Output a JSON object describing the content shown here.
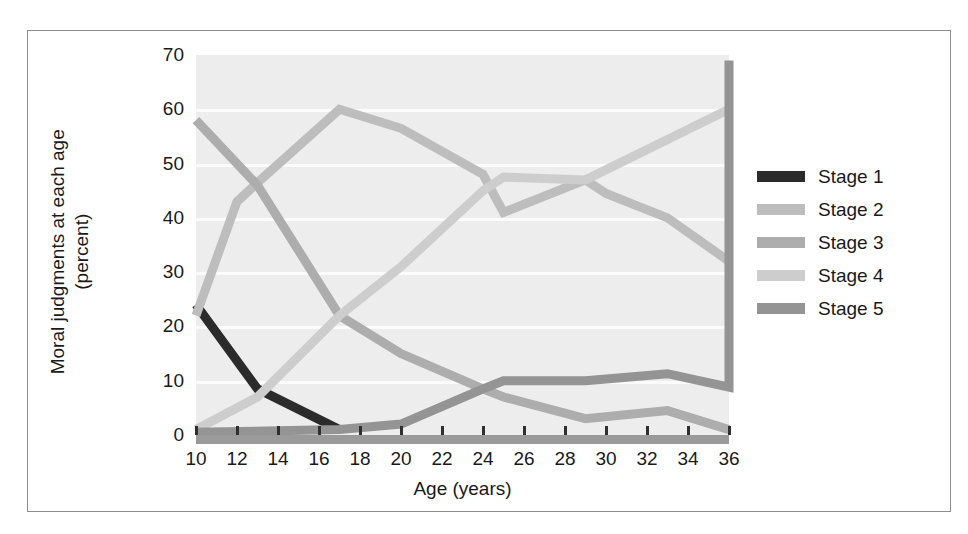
{
  "chart_data": {
    "type": "line",
    "title": "",
    "xlabel": "Age (years)",
    "ylabel_lines": [
      "Moral judgments at each age",
      "(percent)"
    ],
    "ylabel": "Moral judgments at each age (percent)",
    "x": [
      10,
      12,
      14,
      16,
      18,
      20,
      22,
      24,
      26,
      28,
      30,
      32,
      34,
      36
    ],
    "xtick_labels": [
      "10",
      "12",
      "14",
      "16",
      "18",
      "20",
      "22",
      "24",
      "26",
      "28",
      "30",
      "32",
      "34",
      "36"
    ],
    "ytick_labels": [
      "0",
      "10",
      "20",
      "30",
      "40",
      "50",
      "60",
      "70"
    ],
    "yticks": [
      0,
      10,
      20,
      30,
      40,
      50,
      60,
      70
    ],
    "xlim": [
      10,
      36
    ],
    "ylim": [
      0,
      70
    ],
    "grid": true,
    "legend_position": "right",
    "series": [
      {
        "name": "Stage 1",
        "color": "#2b2b2b",
        "points": [
          [
            10,
            24
          ],
          [
            13,
            8.5
          ],
          [
            17,
            1
          ]
        ]
      },
      {
        "name": "Stage 2",
        "color": "#bdbdbd",
        "points": [
          [
            10,
            22
          ],
          [
            12,
            43
          ],
          [
            13,
            46.5
          ],
          [
            17,
            60
          ],
          [
            20,
            56.5
          ],
          [
            24,
            48
          ],
          [
            25,
            41
          ],
          [
            29,
            47
          ],
          [
            30,
            44.5
          ],
          [
            33,
            40
          ],
          [
            36,
            32
          ]
        ]
      },
      {
        "name": "Stage 3",
        "color": "#adadad",
        "points": [
          [
            10,
            58
          ],
          [
            13,
            46
          ],
          [
            17,
            22
          ],
          [
            20,
            15
          ],
          [
            24,
            8.5
          ],
          [
            25,
            7
          ],
          [
            29,
            3
          ],
          [
            33,
            4.5
          ],
          [
            36,
            1
          ]
        ]
      },
      {
        "name": "Stage 4",
        "color": "#cdcdcd",
        "points": [
          [
            10,
            1
          ],
          [
            13,
            7
          ],
          [
            17,
            22
          ],
          [
            20,
            31
          ],
          [
            24,
            45
          ],
          [
            25,
            47.5
          ],
          [
            29,
            47
          ],
          [
            36,
            60
          ]
        ]
      },
      {
        "name": "Stage 5",
        "color": "#949494",
        "points": [
          [
            10,
            0.5
          ],
          [
            17,
            1
          ],
          [
            20,
            2
          ],
          [
            24,
            8.5
          ],
          [
            25,
            10
          ],
          [
            29,
            10
          ],
          [
            33,
            11.3
          ],
          [
            36,
            8.8
          ],
          [
            36,
            69
          ]
        ]
      }
    ]
  },
  "legend": {
    "items": [
      {
        "label": "Stage 1",
        "color": "#2b2b2b"
      },
      {
        "label": "Stage 2",
        "color": "#bdbdbd"
      },
      {
        "label": "Stage 3",
        "color": "#adadad"
      },
      {
        "label": "Stage 4",
        "color": "#cdcdcd"
      },
      {
        "label": "Stage 5",
        "color": "#949494"
      }
    ]
  }
}
